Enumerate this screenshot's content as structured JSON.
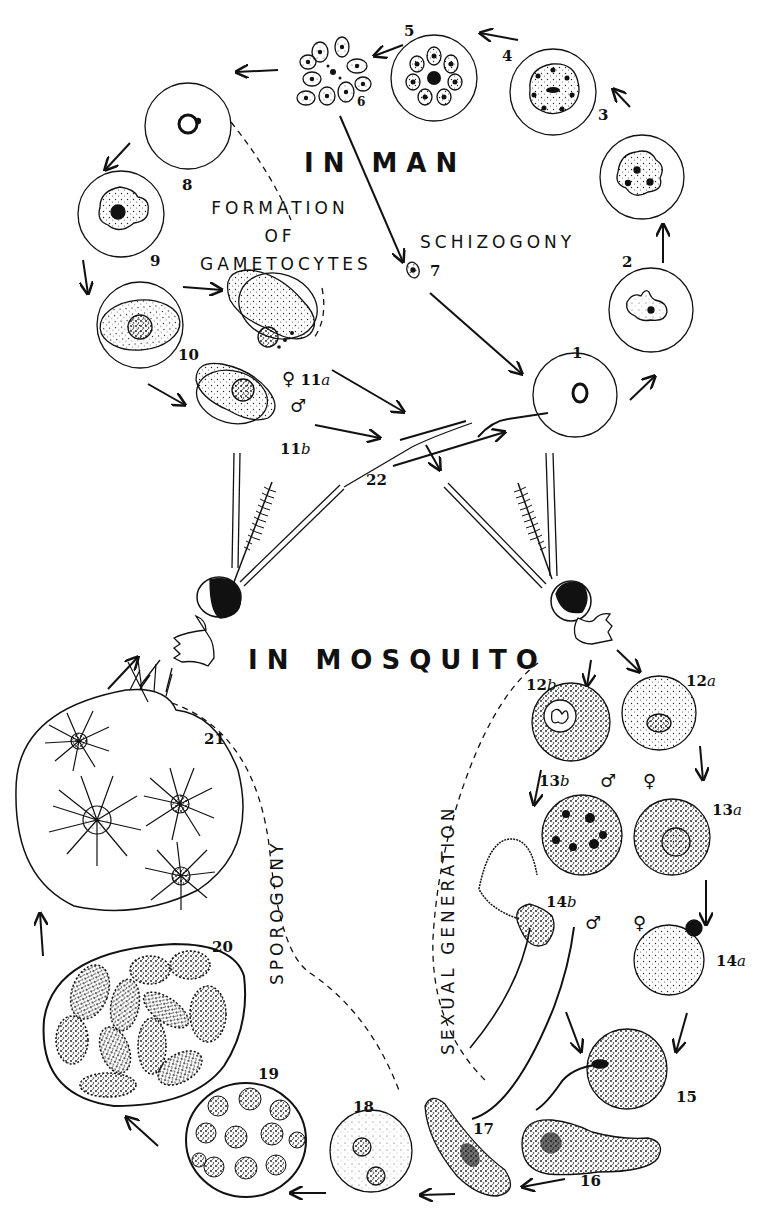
{
  "diagram": {
    "title_top": "IN MAN",
    "title_bottom": "IN MOSQUITO",
    "phases": {
      "gametocytes": [
        "FORMATION",
        "OF",
        "GAMETOCYTES"
      ],
      "schizogony": "SCHIZOGONY",
      "sporogony": "SPOROGONY",
      "sexual_generation": "SEXUAL GENERATION"
    },
    "symbols": {
      "female": "♀",
      "male": "♂"
    },
    "stages": [
      {
        "id": "1",
        "label": "1"
      },
      {
        "id": "2",
        "label": "2"
      },
      {
        "id": "3",
        "label": "3"
      },
      {
        "id": "4",
        "label": "4"
      },
      {
        "id": "5",
        "label": "5"
      },
      {
        "id": "6",
        "label": "6"
      },
      {
        "id": "7",
        "label": "7"
      },
      {
        "id": "8",
        "label": "8"
      },
      {
        "id": "9",
        "label": "9"
      },
      {
        "id": "10",
        "label": "10"
      },
      {
        "id": "11a",
        "num": "11",
        "suffix": "a"
      },
      {
        "id": "11b",
        "num": "11",
        "suffix": "b"
      },
      {
        "id": "12a",
        "num": "12",
        "suffix": "a"
      },
      {
        "id": "12b",
        "num": "12",
        "suffix": "b"
      },
      {
        "id": "13a",
        "num": "13",
        "suffix": "a"
      },
      {
        "id": "13b",
        "num": "13",
        "suffix": "b"
      },
      {
        "id": "14a",
        "num": "14",
        "suffix": "a"
      },
      {
        "id": "14b",
        "num": "14",
        "suffix": "b"
      },
      {
        "id": "15",
        "label": "15"
      },
      {
        "id": "16",
        "label": "16"
      },
      {
        "id": "17",
        "label": "17"
      },
      {
        "id": "18",
        "label": "18"
      },
      {
        "id": "19",
        "label": "19"
      },
      {
        "id": "20",
        "label": "20"
      },
      {
        "id": "21",
        "label": "21"
      },
      {
        "id": "22",
        "label": "22"
      }
    ],
    "colors": {
      "ink": "#111111",
      "paper": "#ffffff"
    }
  }
}
